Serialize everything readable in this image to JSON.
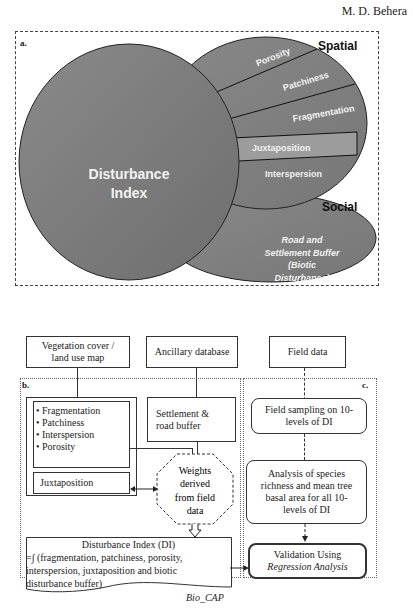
{
  "header": {
    "author": "M. D. Behera"
  },
  "panel_a": {
    "label": "a.",
    "center_circle": "Disturbance Index",
    "center_line1": "Disturbance",
    "center_line2": "Index",
    "spatial_heading": "Spatial",
    "social_heading": "Social",
    "spatial_segments": [
      "Porosity",
      "Patchiness",
      "Fragmentation",
      "Juxtaposition",
      "Interspersion"
    ],
    "social_text": [
      "Road and",
      "Settlement Buffer",
      "(Biotic",
      "Disturbance)"
    ]
  },
  "inputs": {
    "vegetation": [
      "Vegetation cover /",
      "land use map"
    ],
    "ancillary": "Ancillary database",
    "field": "Field data"
  },
  "panel_b": {
    "label": "b.",
    "metrics": [
      "• Fragmentation",
      "• Patchiness",
      "• Interspersion",
      "• Porosity"
    ],
    "juxtaposition": "Juxtaposition",
    "settlement": [
      "Settlement &",
      "road buffer"
    ],
    "weights": [
      "Weights",
      "derived",
      "from field",
      "data"
    ],
    "di_title": "Disturbance Index (DI)",
    "di_formula": [
      "=∫ (fragmentation, patchiness, porosity,",
      "interspersion, juxtaposition and biotic",
      "disturbance buffer)"
    ],
    "tool": "Bio_CAP"
  },
  "panel_c": {
    "label": "c.",
    "sampling": [
      "Field sampling on 10-",
      "levels of DI"
    ],
    "analysis": [
      "Analysis of species",
      "richness and mean tree",
      "basal area for all 10-",
      "levels of DI"
    ],
    "validation_line1": "Validation Using",
    "validation_line2": "Regression Analysis"
  },
  "colors": {
    "circle_fill": "#7a7a7a",
    "segment_fill": "#8a8a8a",
    "juxtaposition_fill": "#a0a0a0",
    "dark_fill": "#6a6a6a"
  }
}
